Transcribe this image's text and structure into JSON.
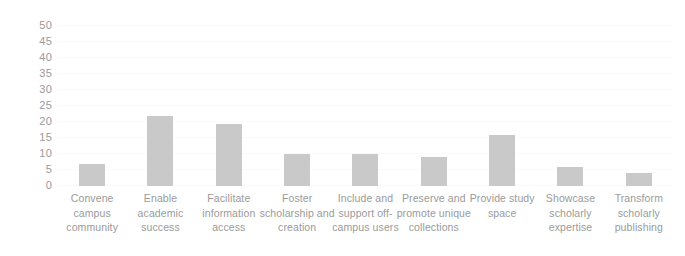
{
  "chart_data": {
    "type": "bar",
    "title": "",
    "subtitle": "",
    "xlabel": "",
    "ylabel": "",
    "ylim": [
      0,
      50
    ],
    "ytick_step": 5,
    "yticks": [
      50,
      45,
      40,
      35,
      30,
      25,
      20,
      15,
      10,
      5,
      0
    ],
    "grid": true,
    "legend": false,
    "legend_position": "none",
    "bar_color": "#c9c9c9",
    "axis_text_color": "#9a9a9a",
    "background_color": "#ffffff",
    "categories": [
      "Convene campus community",
      "Enable academic success",
      "Facilitate information access",
      "Foster scholarship and creation",
      "Include and support off-campus users",
      "Preserve and promote unique collections",
      "Provide study space",
      "Showcase scholarly expertise",
      "Transform scholarly publishing"
    ],
    "values": [
      7,
      22,
      19.5,
      10,
      10,
      9,
      16,
      6,
      4
    ]
  }
}
